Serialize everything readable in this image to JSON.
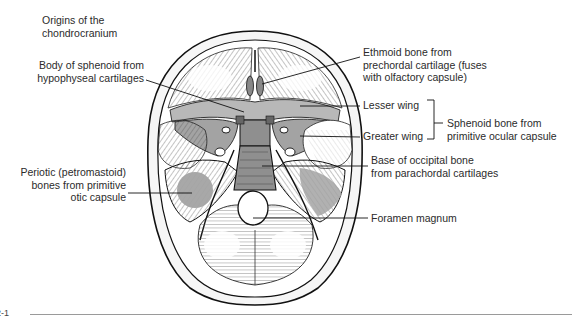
{
  "figure": {
    "title": "Origins of the chondrocranium",
    "title_lines": [
      "Origins of the",
      "chondrocranium"
    ],
    "figure_number_fragment": "2-1",
    "colors": {
      "line": "#1a1a1a",
      "cartilage_shading": "#a3a3a3",
      "background": "#ffffff",
      "text": "#2b2b2b"
    }
  },
  "labels": {
    "body_of_sphenoid": {
      "lines": [
        "Body of sphenoid from",
        "hypophyseal cartilages"
      ]
    },
    "periotic": {
      "lines": [
        "Periotic (petromastoid)",
        "bones from primitive",
        "otic capsule"
      ]
    },
    "ethmoid": {
      "lines": [
        "Ethmoid bone from",
        "prechordal cartilage (fuses",
        "with olfactory capsule)"
      ]
    },
    "lesser_wing": {
      "text": "Lesser wing"
    },
    "greater_wing": {
      "text": "Greater wing"
    },
    "sphenoid_bone": {
      "lines": [
        "Sphenoid bone from",
        "primitive ocular capsule"
      ]
    },
    "base_of_occipital": {
      "lines": [
        "Base of occipital bone",
        "from parachordal cartilages"
      ]
    },
    "foramen_magnum": {
      "text": "Foramen magnum"
    }
  }
}
